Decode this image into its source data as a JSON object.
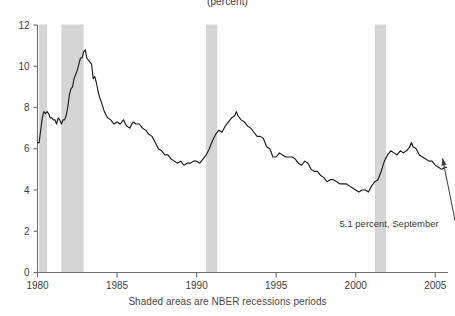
{
  "chart_data": {
    "type": "line",
    "title": "(percent)",
    "subtitle": "",
    "xlabel": "Shaded areas are NBER recessions periods",
    "ylabel": "",
    "xlim": [
      1980.0,
      2005.8
    ],
    "ylim": [
      0,
      12
    ],
    "yticks": [
      0,
      2,
      4,
      6,
      8,
      10,
      12
    ],
    "xticks": [
      1980,
      1985,
      1990,
      1995,
      2000,
      2005
    ],
    "grid": false,
    "legend": "none",
    "annotations": [
      {
        "text": "5.1 percent, September",
        "x": 2002.1,
        "y": 2.2,
        "points_to": {
          "x": 2005.4,
          "y": 5.1
        }
      }
    ],
    "shaded_regions": [
      {
        "label": "NBER recession",
        "start": 1980.1,
        "end": 1980.6
      },
      {
        "label": "NBER recession",
        "start": 1981.5,
        "end": 1982.9
      },
      {
        "label": "NBER recession",
        "start": 1990.6,
        "end": 1991.3
      },
      {
        "label": "NBER recession",
        "start": 2001.2,
        "end": 2001.9
      }
    ],
    "series": [
      {
        "name": "Unemployment rate",
        "x": [
          1980.0,
          1980.1,
          1980.2,
          1980.3,
          1980.4,
          1980.5,
          1980.6,
          1980.7,
          1980.8,
          1980.9,
          1981.0,
          1981.1,
          1981.2,
          1981.3,
          1981.4,
          1981.5,
          1981.6,
          1981.7,
          1981.8,
          1981.9,
          1982.0,
          1982.1,
          1982.2,
          1982.3,
          1982.4,
          1982.5,
          1982.6,
          1982.7,
          1982.8,
          1982.9,
          1983.0,
          1983.1,
          1983.2,
          1983.3,
          1983.4,
          1983.5,
          1983.6,
          1983.7,
          1983.8,
          1983.9,
          1984.0,
          1984.2,
          1984.4,
          1984.6,
          1984.8,
          1985.0,
          1985.2,
          1985.4,
          1985.6,
          1985.8,
          1986.0,
          1986.2,
          1986.4,
          1986.6,
          1986.8,
          1987.0,
          1987.2,
          1987.4,
          1987.6,
          1987.8,
          1988.0,
          1988.2,
          1988.4,
          1988.6,
          1988.8,
          1989.0,
          1989.2,
          1989.4,
          1989.6,
          1989.8,
          1990.0,
          1990.2,
          1990.4,
          1990.6,
          1990.8,
          1991.0,
          1991.2,
          1991.4,
          1991.6,
          1991.8,
          1992.0,
          1992.2,
          1992.4,
          1992.5,
          1992.6,
          1992.8,
          1993.0,
          1993.2,
          1993.4,
          1993.6,
          1993.8,
          1994.0,
          1994.2,
          1994.4,
          1994.6,
          1994.8,
          1995.0,
          1995.2,
          1995.4,
          1995.6,
          1995.8,
          1996.0,
          1996.2,
          1996.4,
          1996.6,
          1996.8,
          1997.0,
          1997.2,
          1997.4,
          1997.6,
          1997.8,
          1998.0,
          1998.2,
          1998.4,
          1998.6,
          1998.8,
          1999.0,
          1999.2,
          1999.4,
          1999.6,
          1999.8,
          2000.0,
          2000.2,
          2000.4,
          2000.6,
          2000.8,
          2001.0,
          2001.2,
          2001.4,
          2001.6,
          2001.8,
          2002.0,
          2002.2,
          2002.4,
          2002.6,
          2002.8,
          2003.0,
          2003.2,
          2003.4,
          2003.5,
          2003.6,
          2003.8,
          2004.0,
          2004.2,
          2004.4,
          2004.6,
          2004.8,
          2005.0,
          2005.2,
          2005.4,
          2005.6,
          2005.7
        ],
        "y": [
          6.3,
          6.3,
          6.9,
          7.5,
          7.8,
          7.7,
          7.8,
          7.7,
          7.5,
          7.5,
          7.4,
          7.4,
          7.2,
          7.5,
          7.4,
          7.2,
          7.4,
          7.4,
          7.6,
          8.0,
          8.6,
          8.9,
          9.0,
          9.4,
          9.6,
          9.8,
          10.1,
          10.4,
          10.4,
          10.7,
          10.8,
          10.4,
          10.3,
          10.2,
          10.1,
          9.4,
          9.5,
          9.2,
          8.8,
          8.5,
          8.3,
          7.8,
          7.5,
          7.4,
          7.2,
          7.3,
          7.2,
          7.4,
          7.1,
          7.0,
          7.3,
          7.2,
          7.2,
          7.0,
          6.9,
          6.7,
          6.6,
          6.3,
          6.0,
          5.9,
          5.7,
          5.7,
          5.5,
          5.4,
          5.3,
          5.4,
          5.2,
          5.3,
          5.3,
          5.4,
          5.4,
          5.3,
          5.5,
          5.7,
          6.0,
          6.4,
          6.7,
          6.9,
          6.8,
          7.1,
          7.3,
          7.5,
          7.6,
          7.8,
          7.6,
          7.4,
          7.3,
          7.1,
          7.0,
          6.8,
          6.6,
          6.6,
          6.5,
          6.1,
          6.0,
          5.6,
          5.6,
          5.8,
          5.7,
          5.6,
          5.6,
          5.6,
          5.5,
          5.3,
          5.2,
          5.4,
          5.3,
          5.0,
          4.9,
          4.9,
          4.7,
          4.6,
          4.4,
          4.5,
          4.5,
          4.4,
          4.3,
          4.3,
          4.3,
          4.2,
          4.1,
          4.0,
          3.9,
          4.0,
          4.0,
          3.9,
          4.2,
          4.4,
          4.5,
          4.9,
          5.4,
          5.7,
          5.9,
          5.8,
          5.7,
          5.9,
          5.8,
          5.9,
          6.1,
          6.3,
          6.1,
          6.0,
          5.7,
          5.6,
          5.5,
          5.4,
          5.4,
          5.2,
          5.1,
          5.0,
          5.1,
          5.1
        ]
      }
    ]
  },
  "axis": {
    "ytick_labels": [
      "0",
      "2",
      "4",
      "6",
      "8",
      "10",
      "12"
    ],
    "xtick_labels": [
      "1980",
      "1985",
      "1990",
      "1995",
      "2000",
      "2005"
    ]
  },
  "caption": {
    "text": "Shaded areas are NBER recessions periods"
  },
  "title": {
    "text": "(percent)"
  },
  "annotation": {
    "label": "5.1 percent, September"
  },
  "colors": {
    "line": "#1c1c1c",
    "band": "#d5d5d5",
    "axis": "#6e6e6e",
    "text": "#3d3d3d",
    "background": "#ffffff"
  }
}
